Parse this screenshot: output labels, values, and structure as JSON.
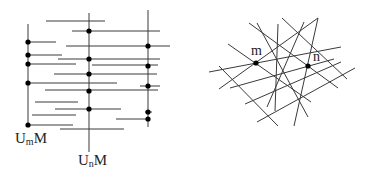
{
  "left_diagram": {
    "vertical_lines": [
      {
        "x": 28,
        "y1": 24,
        "y2": 125
      },
      {
        "x": 89,
        "y1": 13,
        "y2": 152
      },
      {
        "x": 148,
        "y1": 10,
        "y2": 127
      }
    ],
    "horizontal_lines": [
      {
        "x1": 46,
        "y1": 21,
        "x2": 105
      },
      {
        "x1": 72,
        "y1": 31,
        "x2": 160
      },
      {
        "x1": 28,
        "y1": 42,
        "x2": 56
      },
      {
        "x1": 66,
        "y1": 46,
        "x2": 170
      },
      {
        "x1": 28,
        "y1": 55,
        "x2": 62
      },
      {
        "x1": 58,
        "y1": 59,
        "x2": 160
      },
      {
        "x1": 28,
        "y1": 64,
        "x2": 76
      },
      {
        "x1": 92,
        "y1": 65,
        "x2": 158
      },
      {
        "x1": 54,
        "y1": 74,
        "x2": 157
      },
      {
        "x1": 28,
        "y1": 83,
        "x2": 117
      },
      {
        "x1": 140,
        "y1": 86,
        "x2": 160
      },
      {
        "x1": 45,
        "y1": 90,
        "x2": 158
      },
      {
        "x1": 35,
        "y1": 102,
        "x2": 78
      },
      {
        "x1": 55,
        "y1": 109,
        "x2": 121
      },
      {
        "x1": 32,
        "y1": 115,
        "x2": 76
      },
      {
        "x1": 145,
        "y1": 112,
        "x2": 152
      },
      {
        "x1": 116,
        "y1": 119,
        "x2": 148
      },
      {
        "x1": 28,
        "y1": 125,
        "x2": 73
      },
      {
        "x1": 60,
        "y1": 129,
        "x2": 124
      }
    ],
    "dots": [
      {
        "x": 28,
        "y": 42
      },
      {
        "x": 28,
        "y": 55
      },
      {
        "x": 28,
        "y": 64
      },
      {
        "x": 28,
        "y": 83
      },
      {
        "x": 28,
        "y": 125
      },
      {
        "x": 89,
        "y": 31
      },
      {
        "x": 89,
        "y": 59
      },
      {
        "x": 89,
        "y": 74
      },
      {
        "x": 89,
        "y": 91
      },
      {
        "x": 89,
        "y": 109
      },
      {
        "x": 148,
        "y": 46
      },
      {
        "x": 148,
        "y": 66
      },
      {
        "x": 148,
        "y": 86
      },
      {
        "x": 148,
        "y": 112
      },
      {
        "x": 148,
        "y": 119
      }
    ],
    "labels": {
      "um": {
        "base": "U",
        "sub": "m",
        "tail": "M"
      },
      "un": {
        "base": "U",
        "sub": "n",
        "tail": "M"
      }
    }
  },
  "right_diagram": {
    "lines": [
      {
        "x1": 209,
        "y1": 72,
        "x2": 341,
        "y2": 47
      },
      {
        "x1": 219,
        "y1": 89,
        "x2": 318,
        "y2": 18
      },
      {
        "x1": 230,
        "y1": 88,
        "x2": 334,
        "y2": 59
      },
      {
        "x1": 245,
        "y1": 104,
        "x2": 341,
        "y2": 62
      },
      {
        "x1": 257,
        "y1": 122,
        "x2": 355,
        "y2": 68
      },
      {
        "x1": 228,
        "y1": 44,
        "x2": 311,
        "y2": 102
      },
      {
        "x1": 219,
        "y1": 66,
        "x2": 278,
        "y2": 126
      },
      {
        "x1": 249,
        "y1": 23,
        "x2": 338,
        "y2": 88
      },
      {
        "x1": 282,
        "y1": 18,
        "x2": 347,
        "y2": 79
      },
      {
        "x1": 257,
        "y1": 23,
        "x2": 308,
        "y2": 117
      },
      {
        "x1": 278,
        "y1": 24,
        "x2": 275,
        "y2": 111
      },
      {
        "x1": 318,
        "y1": 18,
        "x2": 294,
        "y2": 126
      },
      {
        "x1": 304,
        "y1": 22,
        "x2": 267,
        "y2": 107
      }
    ],
    "dots": [
      {
        "x": 256,
        "y": 63
      },
      {
        "x": 308,
        "y": 66
      }
    ],
    "labels": {
      "m": "m",
      "n": "n"
    }
  },
  "colors": {
    "line": "#3a3a3a",
    "dot": "#000000",
    "background": "#ffffff"
  }
}
